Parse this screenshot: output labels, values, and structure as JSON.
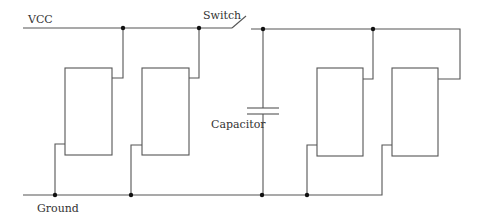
{
  "diagram": {
    "type": "circuit-schematic",
    "labels": {
      "vcc": "VCC",
      "switch": "Switch",
      "capacitor": "Capacitor",
      "ground": "Ground"
    },
    "components": [
      {
        "id": "block-1",
        "kind": "component-box"
      },
      {
        "id": "block-2",
        "kind": "component-box"
      },
      {
        "id": "capacitor",
        "kind": "capacitor"
      },
      {
        "id": "block-3",
        "kind": "component-box"
      },
      {
        "id": "block-4",
        "kind": "component-box"
      },
      {
        "id": "switch",
        "kind": "switch-open"
      }
    ],
    "colors": {
      "wire": "#555555",
      "junction": "#111111",
      "text": "#333333"
    }
  }
}
